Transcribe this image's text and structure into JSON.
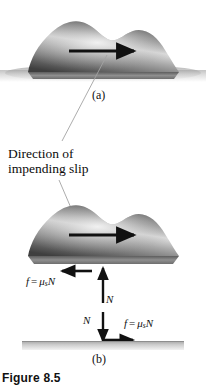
{
  "figure": {
    "caption": "Figure 8.5",
    "panel_a_label": "(a)",
    "panel_b_label": "(b)"
  },
  "annotation": {
    "line1": "Direction of",
    "line2": "impending slip"
  },
  "labels": {
    "friction_top": {
      "f": "f",
      "equals": "=",
      "mu": "μ",
      "sub": "s",
      "N": "N"
    },
    "friction_bottom": {
      "f": "f",
      "equals": "=",
      "mu": "μ",
      "sub": "s",
      "N": "N"
    },
    "normal_up": "N",
    "normal_down": "N"
  },
  "colors": {
    "body_dark": "#4a4a4a",
    "body_mid": "#8d8d8d",
    "body_light": "#e8e8e8",
    "ground": "#b9b9b9",
    "arrow": "#111111",
    "leader": "#9a9a9a",
    "text": "#111111"
  },
  "icons": {
    "motion_arrow_a": "arrow-right-icon",
    "motion_arrow_b": "arrow-right-icon",
    "friction_arrow_block": "arrow-left-icon",
    "friction_arrow_ground": "arrow-right-icon",
    "normal_arrow_up": "arrow-up-icon",
    "normal_arrow_down": "arrow-down-icon"
  }
}
